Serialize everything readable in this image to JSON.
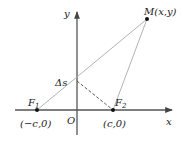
{
  "diagram": {
    "axes": {
      "x_label": "x",
      "y_label": "y",
      "origin_label": "O"
    },
    "points": {
      "F1": {
        "name": "F",
        "subscript": "1",
        "coord_label": "(−c,0)"
      },
      "F2": {
        "name": "F",
        "subscript": "2",
        "coord_label": "(c,0)"
      },
      "M": {
        "label": "M(x,y)"
      },
      "delta": {
        "label": "Δs"
      }
    },
    "colors": {
      "axis": "#555555",
      "line": "#aaaaaa",
      "dashed": "#444444",
      "point": "#111111"
    }
  }
}
